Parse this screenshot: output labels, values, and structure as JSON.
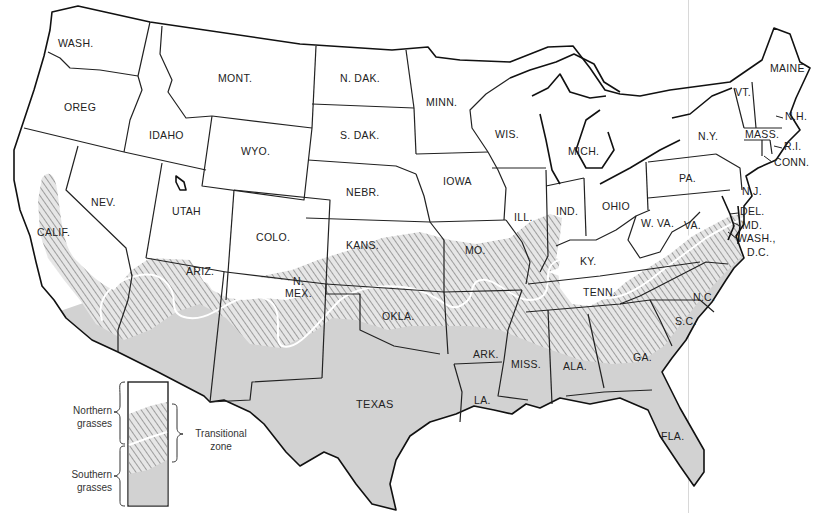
{
  "map": {
    "title": "Grass zones of the contiguous United States",
    "colors": {
      "southern_fill": "#d2d2d2",
      "northern_fill": "#ffffff",
      "hatch": "#8a8a8a",
      "border": "#222222",
      "divide_line": "#ffffff"
    },
    "states": [
      {
        "id": "wash",
        "label": "WASH.",
        "x": 58,
        "y": 47
      },
      {
        "id": "oreg",
        "label": "OREG",
        "x": 64,
        "y": 111
      },
      {
        "id": "calif",
        "label": "CALIF.",
        "x": 37,
        "y": 236
      },
      {
        "id": "nev",
        "label": "NEV.",
        "x": 91,
        "y": 206
      },
      {
        "id": "idaho",
        "label": "IDAHO",
        "x": 149,
        "y": 139
      },
      {
        "id": "mont",
        "label": "MONT.",
        "x": 218,
        "y": 82
      },
      {
        "id": "wyo",
        "label": "WYO.",
        "x": 241,
        "y": 155
      },
      {
        "id": "utah",
        "label": "UTAH",
        "x": 172,
        "y": 215
      },
      {
        "id": "colo",
        "label": "COLO.",
        "x": 256,
        "y": 241
      },
      {
        "id": "ariz",
        "label": "ARIZ.",
        "x": 186,
        "y": 275
      },
      {
        "id": "nmex1",
        "label": "N.",
        "x": 293,
        "y": 285
      },
      {
        "id": "nmex2",
        "label": "MEX.",
        "x": 285,
        "y": 297
      },
      {
        "id": "ndak",
        "label": "N. DAK.",
        "x": 340,
        "y": 82
      },
      {
        "id": "sdak",
        "label": "S. DAK.",
        "x": 340,
        "y": 139
      },
      {
        "id": "nebr",
        "label": "NEBR.",
        "x": 346,
        "y": 196
      },
      {
        "id": "kans",
        "label": "KANS.",
        "x": 346,
        "y": 249
      },
      {
        "id": "okla",
        "label": "OKLA.",
        "x": 382,
        "y": 320
      },
      {
        "id": "texas",
        "label": "TEXAS",
        "x": 356,
        "y": 408
      },
      {
        "id": "minn",
        "label": "MINN.",
        "x": 426,
        "y": 106
      },
      {
        "id": "iowa",
        "label": "IOWA",
        "x": 443,
        "y": 185
      },
      {
        "id": "mo",
        "label": "MO.",
        "x": 465,
        "y": 254
      },
      {
        "id": "ark",
        "label": "ARK.",
        "x": 473,
        "y": 358
      },
      {
        "id": "la",
        "label": "LA.",
        "x": 474,
        "y": 404
      },
      {
        "id": "wis",
        "label": "WIS.",
        "x": 495,
        "y": 138
      },
      {
        "id": "ill",
        "label": "ILL.",
        "x": 514,
        "y": 221
      },
      {
        "id": "mich",
        "label": "MICH.",
        "x": 568,
        "y": 155
      },
      {
        "id": "ind",
        "label": "IND.",
        "x": 556,
        "y": 215
      },
      {
        "id": "ohio",
        "label": "OHIO",
        "x": 602,
        "y": 210
      },
      {
        "id": "ky",
        "label": "KY.",
        "x": 580,
        "y": 265
      },
      {
        "id": "tenn",
        "label": "TENN.",
        "x": 583,
        "y": 296
      },
      {
        "id": "miss",
        "label": "MISS.",
        "x": 511,
        "y": 368
      },
      {
        "id": "ala",
        "label": "ALA.",
        "x": 563,
        "y": 370
      },
      {
        "id": "ga",
        "label": "GA.",
        "x": 633,
        "y": 361
      },
      {
        "id": "fla",
        "label": "FLA.",
        "x": 661,
        "y": 440
      },
      {
        "id": "sc",
        "label": "S.C.",
        "x": 675,
        "y": 325
      },
      {
        "id": "nc",
        "label": "N.C.",
        "x": 693,
        "y": 301
      },
      {
        "id": "va",
        "label": "VA.",
        "x": 684,
        "y": 229
      },
      {
        "id": "wva",
        "label": "W. VA.",
        "x": 641,
        "y": 227
      },
      {
        "id": "pa",
        "label": "PA.",
        "x": 679,
        "y": 182
      },
      {
        "id": "ny",
        "label": "N.Y.",
        "x": 698,
        "y": 140
      },
      {
        "id": "nj",
        "label": "N.J.",
        "x": 742,
        "y": 195
      },
      {
        "id": "del",
        "label": "DEL.",
        "x": 740,
        "y": 215
      },
      {
        "id": "md",
        "label": "MD.",
        "x": 742,
        "y": 229
      },
      {
        "id": "dc1",
        "label": "WASH.,",
        "x": 737,
        "y": 242
      },
      {
        "id": "dc2",
        "label": "D.C.",
        "x": 747,
        "y": 256
      },
      {
        "id": "vt",
        "label": "VT.",
        "x": 735,
        "y": 96
      },
      {
        "id": "nh",
        "label": "N.H.",
        "x": 785,
        "y": 120
      },
      {
        "id": "mass",
        "label": "MASS.",
        "x": 745,
        "y": 138
      },
      {
        "id": "ri",
        "label": "R.I.",
        "x": 784,
        "y": 150
      },
      {
        "id": "conn",
        "label": "CONN.",
        "x": 774,
        "y": 166
      },
      {
        "id": "maine",
        "label": "MAINE",
        "x": 770,
        "y": 72
      }
    ]
  },
  "legend": {
    "northern": "Northern grasses",
    "northern_line1": "Northern",
    "northern_line2": "grasses",
    "southern_line1": "Southern",
    "southern_line2": "grasses",
    "transitional_line1": "Transitional",
    "transitional_line2": "zone"
  }
}
